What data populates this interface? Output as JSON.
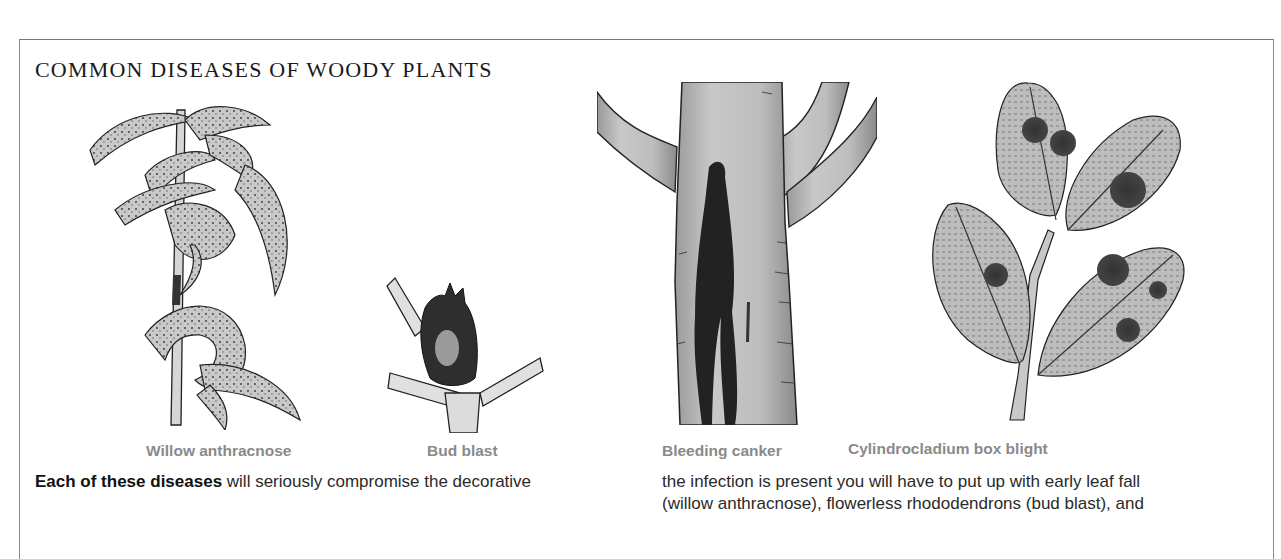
{
  "page": {
    "title": "COMMON DISEASES OF WOODY PLANTS"
  },
  "illustrations": [
    {
      "id": "willow-anthracnose",
      "caption": "Willow anthracnose"
    },
    {
      "id": "bud-blast",
      "caption": "Bud blast"
    },
    {
      "id": "bleeding-canker",
      "caption": "Bleeding canker"
    },
    {
      "id": "cylindrocladium-box-blight",
      "caption": "Cylindrocladium box blight"
    }
  ],
  "body": {
    "left_column": {
      "lead_bold": "Each of these diseases",
      "line1_rest": " will seriously compromise the decorative"
    },
    "right_column": {
      "line1": "the infection is present you will have to put up with early leaf fall",
      "line2": "(willow anthracnose), flowerless rhododendrons (bud blast), and"
    }
  },
  "colors": {
    "caption": "#8a8a8a",
    "text": "#2a2a2a",
    "border": "#888888"
  }
}
